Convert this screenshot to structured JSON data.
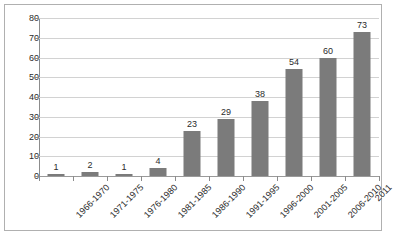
{
  "chart_data": {
    "type": "bar",
    "title": "",
    "subtitle": "",
    "xlabel": "",
    "ylabel": "",
    "categories": [
      "1966-1970",
      "1971-1975",
      "1976-1980",
      "1981-1985",
      "1986-1990",
      "1991-1995",
      "1996-2000",
      "2001-2005",
      "2006-2010",
      "2011"
    ],
    "values": [
      1,
      2,
      1,
      4,
      23,
      29,
      38,
      54,
      60,
      73
    ],
    "data_labels": [
      "1",
      "2",
      "1",
      "4",
      "23",
      "29",
      "38",
      "54",
      "60",
      "73"
    ],
    "ylim": [
      0,
      80
    ],
    "ytick_step": 10,
    "yticks": [
      "80",
      "70",
      "60",
      "50",
      "40",
      "30",
      "20",
      "10",
      "0"
    ],
    "ytick_values": [
      80,
      70,
      60,
      50,
      40,
      30,
      20,
      10,
      0
    ],
    "grid": true,
    "legend": null,
    "legend_position": "none",
    "bar_color": "#7b7b7b",
    "gridline_color": "#d2d2d2",
    "axis_color": "#8c8c8c",
    "label_color": "#2b2b2b",
    "background_color": "#ffffff",
    "frame_color": "#b0b0b0",
    "xlabel_rotation": -45
  }
}
